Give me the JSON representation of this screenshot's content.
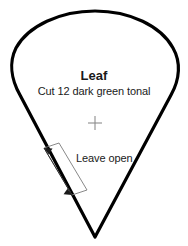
{
  "document": {
    "type": "sewing-pattern-template",
    "shape_name": "leaf-teardrop-outline",
    "background_color": "#ffffff"
  },
  "pattern": {
    "title": "Leaf",
    "instruction": "Cut 12 dark green tonal",
    "outline_color": "#000000",
    "outline_width_px": 3,
    "registration_mark": {
      "icon": "cross-mark-icon",
      "color": "#8c8c8c",
      "center_x": 95,
      "center_y": 123,
      "arm_length_px": 7
    },
    "annotation": {
      "label": "Leave open",
      "marker_icon": "double-headed-arrow-icon",
      "marker_color": "#5a5a5a",
      "start_x": 44,
      "start_y": 148,
      "end_x": 72,
      "end_y": 195
    }
  }
}
